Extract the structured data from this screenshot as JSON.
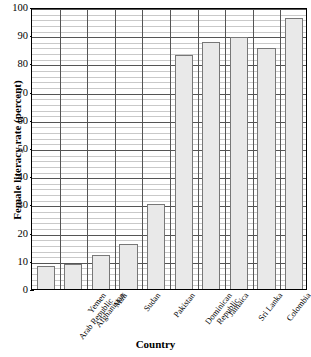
{
  "chart_data": {
    "type": "bar",
    "title": "",
    "xlabel": "Country",
    "ylabel": "Female literacy rate (percent)",
    "ylim": [
      0,
      100
    ],
    "ytick_step": 10,
    "yminor_step": 2,
    "grid": true,
    "legend": "none",
    "categories": [
      "Yemen Arab Republic",
      "Afghanistan",
      "Mali",
      "Sudan",
      "Pakistan",
      "Dominican Republic",
      "Jamaica",
      "Sri Lanka",
      "Colombia",
      "Thailand"
    ],
    "category_lines": [
      [
        "Yemen",
        "Arab Republic"
      ],
      [
        "Afghanistan"
      ],
      [
        "Mali"
      ],
      [
        "Sudan"
      ],
      [
        "Pakistan"
      ],
      [
        "Dominican",
        "Republic"
      ],
      [
        "Jamaica"
      ],
      [
        "Sri Lanka"
      ],
      [
        "Colombia"
      ],
      [
        "Thailand"
      ]
    ],
    "values": [
      8,
      9,
      12,
      16,
      30,
      83,
      87.5,
      89.5,
      85.5,
      96
    ],
    "yticks": [
      0,
      10,
      20,
      30,
      40,
      50,
      60,
      70,
      80,
      90,
      100
    ],
    "ytick_labels": [
      "0",
      "10",
      "20",
      "30",
      "40",
      "50",
      "60",
      "70",
      "80",
      "90",
      "100"
    ],
    "colors": {
      "bar_fill": "#e9e9e9",
      "bar_border": "#777777",
      "grid_major": "#555555",
      "grid_minor": "#c9c9c9",
      "frame": "#000000",
      "text": "#000000",
      "background": "#ffffff"
    }
  }
}
